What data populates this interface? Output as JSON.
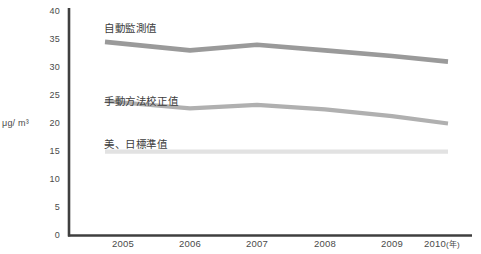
{
  "chart_data": {
    "type": "line",
    "title": "",
    "xlabel": "年",
    "ylabel": "μg/ m³",
    "x": [
      "2005",
      "2006",
      "2007",
      "2008",
      "2009",
      "2010"
    ],
    "categories": [
      "2005",
      "2006",
      "2007",
      "2008",
      "2009",
      "2010"
    ],
    "ylim": [
      0,
      40
    ],
    "yticks": [
      "0",
      "5",
      "10",
      "15",
      "20",
      "25",
      "30",
      "35",
      "40"
    ],
    "grid": false,
    "legend": "inline-labels",
    "series": [
      {
        "name": "自動監測值",
        "color": "#9a9a9a",
        "values": [
          34.5,
          33.0,
          34.0,
          33.0,
          32.0,
          31.0
        ]
      },
      {
        "name": "手動方法校正值",
        "color": "#b0b0b0",
        "values": [
          24.0,
          22.7,
          23.3,
          22.5,
          21.3,
          20.0
        ]
      },
      {
        "name": "美、日標準值",
        "color": "#e2e2e2",
        "values": [
          15,
          15,
          15,
          15,
          15,
          15
        ]
      }
    ]
  },
  "axes": {
    "y_title": "μg/ m³",
    "y_ticks": [
      {
        "label": "40",
        "value": 40
      },
      {
        "label": "35",
        "value": 35
      },
      {
        "label": "30",
        "value": 30
      },
      {
        "label": "25",
        "value": 25
      },
      {
        "label": "20",
        "value": 20
      },
      {
        "label": "15",
        "value": 15
      },
      {
        "label": "10",
        "value": 10
      },
      {
        "label": "5",
        "value": 5
      },
      {
        "label": "0",
        "value": 0
      }
    ],
    "x_ticks": [
      {
        "label": "2005"
      },
      {
        "label": "2006"
      },
      {
        "label": "2007"
      },
      {
        "label": "2008"
      },
      {
        "label": "2009"
      },
      {
        "label": "2010"
      }
    ],
    "x_unit": "(年)",
    "axis_color": "#3f3f3f"
  },
  "series_labels": {
    "auto": "自動監測值",
    "manual": "手動方法校正值",
    "standard": "美、日標準值"
  },
  "colors": {
    "line_auto": "#9a9a9a",
    "line_manual": "#b0b0b0",
    "line_standard": "#e2e2e2",
    "axis": "#3f3f3f",
    "text": "#4a4a4a",
    "background": "#ffffff"
  }
}
